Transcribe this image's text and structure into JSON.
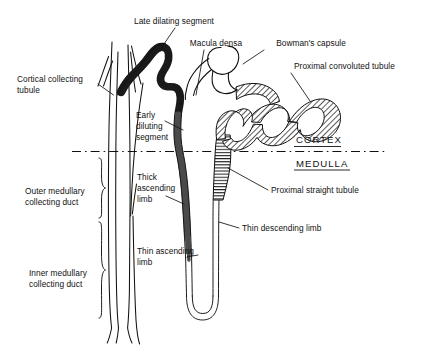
{
  "figure": {
    "background_color": "#ffffff",
    "ink_color": "#111111"
  },
  "regions": {
    "cortex_label": "CORTEX",
    "medulla_label": "MEDULLA",
    "divider_style": "dash-dot horizontal line"
  },
  "labels": {
    "late_dilating_segment": "Late dilating segment",
    "macula_densa": "Macula densa",
    "bowmans_capsule": "Bowman's capsule",
    "proximal_convoluted_tubule": "Proximal convoluted tubule",
    "cortical_collecting_tubule_line1": "Cortical collecting",
    "cortical_collecting_tubule_line2": "tubule",
    "early_diluting_segment_line1": "Early",
    "early_diluting_segment_line2": "diluting",
    "early_diluting_segment_line3": "segment",
    "outer_medullary_collecting_duct_line1": "Outer medullary",
    "outer_medullary_collecting_duct_line2": "collecting duct",
    "inner_medullary_collecting_duct_line1": "Inner medullary",
    "inner_medullary_collecting_duct_line2": "collecting duct",
    "thick_ascending_limb_line1": "Thick",
    "thick_ascending_limb_line2": "ascending",
    "thick_ascending_limb_line3": "limb",
    "thin_ascending_limb_line1": "Thin ascending",
    "thin_ascending_limb_line2": "limb",
    "proximal_straight_tubule": "Proximal straight tubule",
    "thin_descending_limb": "Thin descending limb"
  },
  "structures": {
    "late_dilating_segment": {
      "name": "Late dilating segment",
      "fill": "#1a1a1a",
      "style": "solid dark wavy tube"
    },
    "early_diluting_segment": {
      "name": "Early diluting segment",
      "fill": "#4a4a4a",
      "style": "solid dark tapering tube"
    },
    "thick_ascending_limb": {
      "name": "Thick ascending limb",
      "fill": "#4a4a4a",
      "style": "solid dark vertical tapering tube"
    },
    "thin_ascending_limb": {
      "name": "Thin ascending limb",
      "fill": "#ffffff",
      "style": "thin double-line tube"
    },
    "thin_descending_limb": {
      "name": "Thin descending limb",
      "fill": "#ffffff",
      "style": "thin double-line tube"
    },
    "proximal_convoluted_tubule": {
      "name": "Proximal convoluted tubule",
      "fill": "hatched",
      "style": "diagonal cross-hatch convoluted tube"
    },
    "proximal_straight_tubule": {
      "name": "Proximal straight tubule",
      "fill": "horizontal-stripes",
      "style": "horizontally striped tapering tube"
    },
    "bowmans_capsule": {
      "name": "Bowman's capsule",
      "fill": "#ffffff",
      "style": "open C-shaped outline"
    },
    "macula_densa": {
      "name": "Macula densa",
      "style": "junction point on distal tubule"
    },
    "cortical_collecting_tubule": {
      "name": "Cortical collecting tubule",
      "style": "branching thin converging lines"
    },
    "outer_medullary_collecting_duct": {
      "name": "Outer medullary collecting duct",
      "style": "vertical duct with brace"
    },
    "inner_medullary_collecting_duct": {
      "name": "Inner medullary collecting duct",
      "style": "vertical duct with brace"
    }
  }
}
